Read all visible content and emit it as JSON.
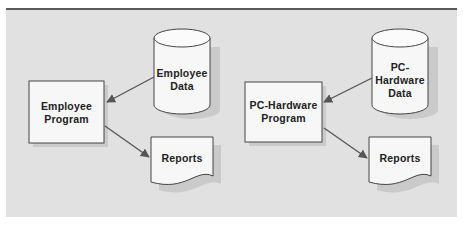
{
  "diagram": {
    "left": {
      "data_store": {
        "line1": "Employee",
        "line2": "Data"
      },
      "program": {
        "line1": "Employee",
        "line2": "Program"
      },
      "output": {
        "label": "Reports"
      }
    },
    "right": {
      "data_store": {
        "line1": "PC-",
        "line2": "Hardware",
        "line3": "Data"
      },
      "program": {
        "line1": "PC-Hardware",
        "line2": "Program"
      },
      "output": {
        "label": "Reports"
      }
    }
  },
  "colors": {
    "panel_bg": "#e1e1e1",
    "shape_fill": "#f7f7f7",
    "stroke": "#444444",
    "arrow": "#555555",
    "top_rule": "#5a5a5a"
  }
}
